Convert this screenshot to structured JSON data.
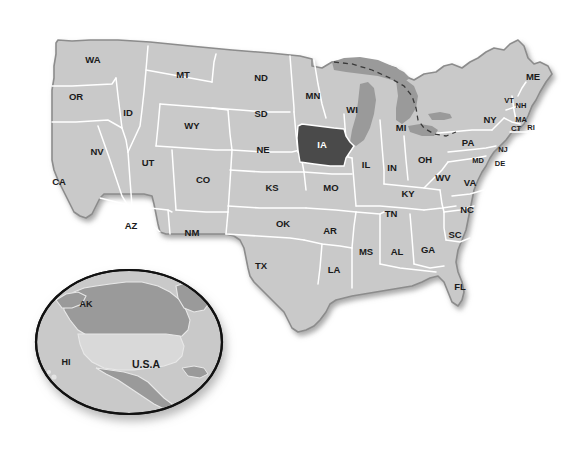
{
  "map": {
    "title": "United States map with Iowa highlighted",
    "background_color": "#ffffff",
    "state_fill": "#c9c9c9",
    "state_border": "#ffffff",
    "highlight_fill": "#4a4a4a",
    "highlight_label_color": "#ffffff",
    "lake_fill": "#9a9a9a",
    "outline_color": "#8c8c8c",
    "highlighted_state": "IA",
    "bold_state": "IL",
    "states": [
      {
        "code": "WA",
        "x": 93,
        "y": 60,
        "size": "md"
      },
      {
        "code": "OR",
        "x": 76,
        "y": 97,
        "size": "md"
      },
      {
        "code": "ID",
        "x": 128,
        "y": 113,
        "size": "md"
      },
      {
        "code": "MT",
        "x": 183,
        "y": 75,
        "size": "md"
      },
      {
        "code": "WY",
        "x": 192,
        "y": 126,
        "size": "md"
      },
      {
        "code": "NV",
        "x": 97,
        "y": 152,
        "size": "md"
      },
      {
        "code": "UT",
        "x": 148,
        "y": 163,
        "size": "md"
      },
      {
        "code": "CA",
        "x": 59,
        "y": 182,
        "size": "md"
      },
      {
        "code": "CO",
        "x": 203,
        "y": 180,
        "size": "md"
      },
      {
        "code": "AZ",
        "x": 131,
        "y": 226,
        "size": "md"
      },
      {
        "code": "NM",
        "x": 192,
        "y": 233,
        "size": "md"
      },
      {
        "code": "ND",
        "x": 261,
        "y": 78,
        "size": "md"
      },
      {
        "code": "SD",
        "x": 261,
        "y": 114,
        "size": "md"
      },
      {
        "code": "NE",
        "x": 263,
        "y": 150,
        "size": "md"
      },
      {
        "code": "KS",
        "x": 272,
        "y": 188,
        "size": "md"
      },
      {
        "code": "OK",
        "x": 283,
        "y": 224,
        "size": "md"
      },
      {
        "code": "TX",
        "x": 261,
        "y": 266,
        "size": "md"
      },
      {
        "code": "MN",
        "x": 313,
        "y": 96,
        "size": "md"
      },
      {
        "code": "IA",
        "x": 322,
        "y": 145,
        "size": "md",
        "highlight": true
      },
      {
        "code": "MO",
        "x": 331,
        "y": 188,
        "size": "md"
      },
      {
        "code": "AR",
        "x": 330,
        "y": 231,
        "size": "md"
      },
      {
        "code": "LA",
        "x": 334,
        "y": 270,
        "size": "md"
      },
      {
        "code": "WI",
        "x": 352,
        "y": 110,
        "size": "md"
      },
      {
        "code": "IL",
        "x": 366,
        "y": 165,
        "size": "md",
        "bold": true
      },
      {
        "code": "MS",
        "x": 366,
        "y": 252,
        "size": "md"
      },
      {
        "code": "MI",
        "x": 401,
        "y": 128,
        "size": "md"
      },
      {
        "code": "IN",
        "x": 392,
        "y": 168,
        "size": "md"
      },
      {
        "code": "AL",
        "x": 397,
        "y": 252,
        "size": "md"
      },
      {
        "code": "TN",
        "x": 391,
        "y": 214,
        "size": "md"
      },
      {
        "code": "KY",
        "x": 408,
        "y": 194,
        "size": "md"
      },
      {
        "code": "OH",
        "x": 425,
        "y": 160,
        "size": "md"
      },
      {
        "code": "GA",
        "x": 428,
        "y": 250,
        "size": "md"
      },
      {
        "code": "WV",
        "x": 443,
        "y": 178,
        "size": "md"
      },
      {
        "code": "SC",
        "x": 455,
        "y": 235,
        "size": "md"
      },
      {
        "code": "NC",
        "x": 467,
        "y": 210,
        "size": "md"
      },
      {
        "code": "VA",
        "x": 470,
        "y": 183,
        "size": "md"
      },
      {
        "code": "PA",
        "x": 468,
        "y": 143,
        "size": "md"
      },
      {
        "code": "NY",
        "x": 490,
        "y": 120,
        "size": "md"
      },
      {
        "code": "ME",
        "x": 533,
        "y": 77,
        "size": "md"
      },
      {
        "code": "FL",
        "x": 460,
        "y": 287,
        "size": "md"
      },
      {
        "code": "MD",
        "x": 478,
        "y": 161,
        "size": "sm"
      },
      {
        "code": "DE",
        "x": 500,
        "y": 164,
        "size": "sm"
      },
      {
        "code": "NJ",
        "x": 503,
        "y": 150,
        "size": "sm"
      },
      {
        "code": "VT",
        "x": 509,
        "y": 101,
        "size": "sm"
      },
      {
        "code": "NH",
        "x": 521,
        "y": 106,
        "size": "sm"
      },
      {
        "code": "MA",
        "x": 521,
        "y": 120,
        "size": "sm"
      },
      {
        "code": "CT",
        "x": 516,
        "y": 129,
        "size": "sm"
      },
      {
        "code": "RI",
        "x": 531,
        "y": 128,
        "size": "sm"
      }
    ]
  },
  "inset": {
    "name": "globe-inset",
    "ocean_fill": "#c9c9c9",
    "land_fill": "#9a9a9a",
    "usa_fill": "#d7d7d7",
    "ring_color": "#111111",
    "labels": [
      {
        "text": "AK",
        "x": 86,
        "y": 305,
        "size": "globe"
      },
      {
        "text": "HI",
        "x": 66,
        "y": 363,
        "size": "globe"
      },
      {
        "text": "U.S.A",
        "x": 146,
        "y": 365,
        "size": "usa"
      }
    ]
  }
}
